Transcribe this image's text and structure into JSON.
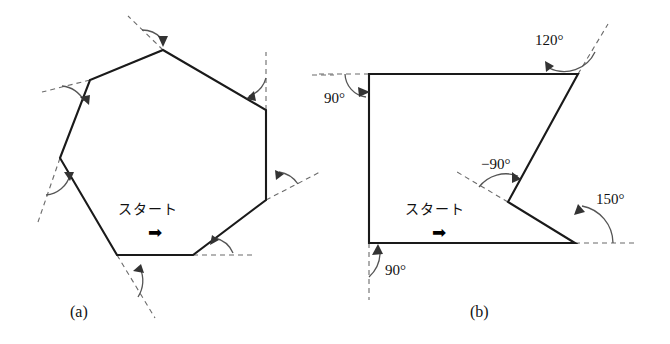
{
  "figure": {
    "background": "#ffffff",
    "stroke_color": "#1a1a1a",
    "dash_color": "#6b6b6b",
    "arc_color": "#555555",
    "panels": [
      {
        "id": "a",
        "label": "(a)",
        "caption_label": "(a)",
        "shape": "regular-heptagon",
        "description": "regular heptagon traced by a turtle, exterior turn angle arc drawn unlabeled at every vertex",
        "start_marker": {
          "text": "スタート",
          "arrow_glyph": "➡",
          "direction": "right"
        },
        "vertices": [
          [
            117,
            255
          ],
          [
            193,
            255
          ],
          [
            266,
            200
          ],
          [
            266,
            110
          ],
          [
            163,
            50
          ],
          [
            90,
            80
          ],
          [
            60,
            158
          ]
        ],
        "angle_marks": [
          {
            "at_vertex": 1,
            "label": "",
            "arc": true,
            "dashed_extension": true
          },
          {
            "at_vertex": 2,
            "label": "",
            "arc": true,
            "dashed_extension": true
          },
          {
            "at_vertex": 3,
            "label": "",
            "arc": true,
            "dashed_extension": true
          },
          {
            "at_vertex": 4,
            "label": "",
            "arc": true,
            "dashed_extension": true
          },
          {
            "at_vertex": 5,
            "label": "",
            "arc": true,
            "dashed_extension": true
          },
          {
            "at_vertex": 6,
            "label": "",
            "arc": true,
            "dashed_extension": true
          },
          {
            "at_vertex": 0,
            "label": "",
            "arc": true,
            "dashed_extension": true
          }
        ]
      },
      {
        "id": "b",
        "label": "(b)",
        "caption_label": "(b)",
        "shape": "concave-pentagon",
        "description": "non-convex polygon traced by a turtle with labelled turn angles including one negative turn",
        "start_marker": {
          "text": "スタート",
          "arrow_glyph": "➡",
          "direction": "right"
        },
        "vertices": [
          [
            369,
            243
          ],
          [
            575,
            243
          ],
          [
            508,
            202
          ],
          [
            578,
            74
          ],
          [
            369,
            74
          ]
        ],
        "angle_marks": [
          {
            "at_vertex": 1,
            "label": "150°",
            "label_x": 596,
            "label_y": 191
          },
          {
            "at_vertex": 2,
            "label": "−90°",
            "label_x": 487,
            "label_y": 156
          },
          {
            "at_vertex": 3,
            "label": "120°",
            "label_x": 535,
            "label_y": 32
          },
          {
            "at_vertex": 4,
            "label": "90°",
            "label_x": 324,
            "label_y": 90
          },
          {
            "at_vertex": 0,
            "label": "90°",
            "label_x": 385,
            "label_y": 262
          }
        ]
      }
    ]
  }
}
